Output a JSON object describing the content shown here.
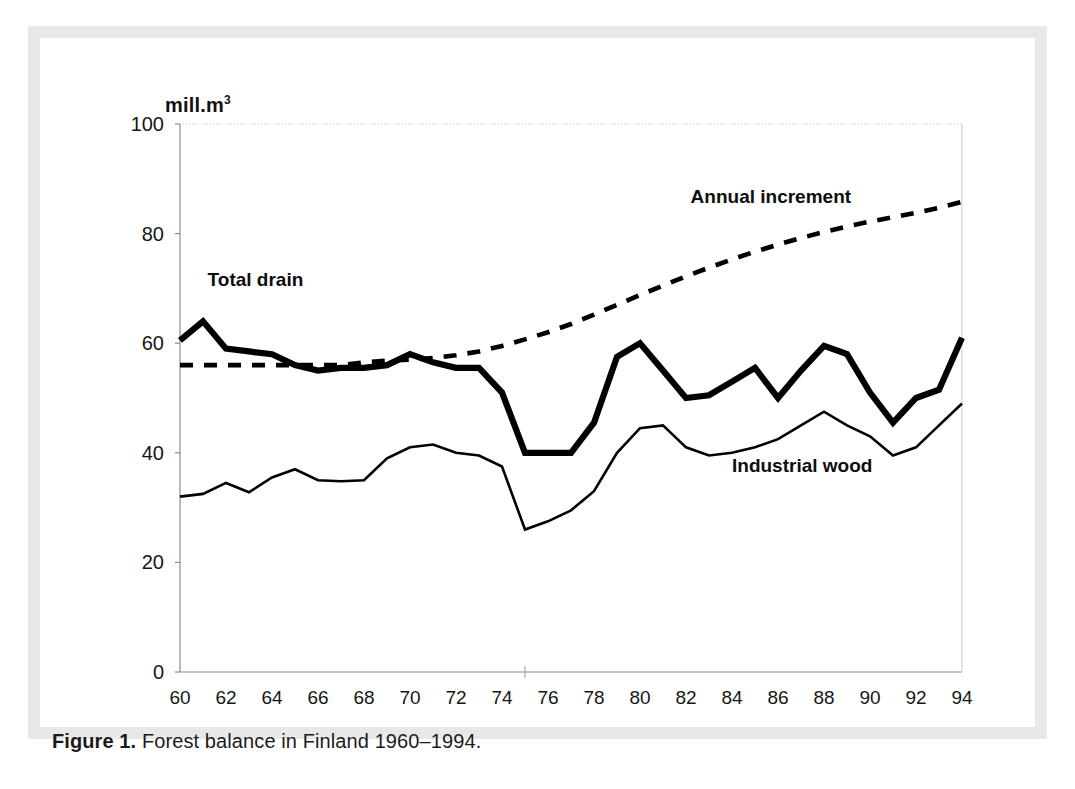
{
  "figure": {
    "caption_bold": "Figure 1.",
    "caption_text": " Forest balance in Finland 1960–1994.",
    "unit_label": "mill.m",
    "unit_sup": "3"
  },
  "colors": {
    "frame": "#e8e8e8",
    "plot_background": "#ffffff",
    "line": "#000000",
    "axis": "#8d8d8d",
    "text": "#161616"
  },
  "chart_data": {
    "type": "line",
    "title": "Forest balance in Finland 1960–1994",
    "xlabel": "",
    "ylabel": "mill.m³",
    "xlim": [
      1960,
      1994
    ],
    "ylim": [
      0,
      100
    ],
    "yticks": [
      0,
      20,
      40,
      60,
      80,
      100
    ],
    "ytick_labels": [
      "0",
      "20",
      "40",
      "60",
      "80",
      "100"
    ],
    "xticks": [
      1960,
      1962,
      1964,
      1966,
      1968,
      1970,
      1972,
      1974,
      1976,
      1978,
      1980,
      1982,
      1984,
      1986,
      1988,
      1990,
      1992,
      1994
    ],
    "xtick_labels": [
      "60",
      "62",
      "64",
      "66",
      "68",
      "70",
      "72",
      "74",
      "76",
      "78",
      "80",
      "82",
      "84",
      "86",
      "88",
      "90",
      "92",
      "94"
    ],
    "grid": false,
    "legend_position": "inline-annotations",
    "x": [
      1960,
      1961,
      1962,
      1963,
      1964,
      1965,
      1966,
      1967,
      1968,
      1969,
      1970,
      1971,
      1972,
      1973,
      1974,
      1975,
      1976,
      1977,
      1978,
      1979,
      1980,
      1981,
      1982,
      1983,
      1984,
      1985,
      1986,
      1987,
      1988,
      1989,
      1990,
      1991,
      1992,
      1993,
      1994
    ],
    "series": [
      {
        "name": "Total drain",
        "style": "solid-thick",
        "label_x": 1961.2,
        "label_y": 70.5,
        "values": [
          60.5,
          64.0,
          59.0,
          58.5,
          58.0,
          56.0,
          55.0,
          55.5,
          55.5,
          56.0,
          58.0,
          56.5,
          55.5,
          55.5,
          51.0,
          40.0,
          40.0,
          40.0,
          45.5,
          57.5,
          60.0,
          55.0,
          50.0,
          50.5,
          53.0,
          55.5,
          50.0,
          55.0,
          59.5,
          58.0,
          51.0,
          45.5,
          50.0,
          51.5,
          61.0
        ]
      },
      {
        "name": "Annual increment",
        "style": "dashed",
        "label_x": 1982.2,
        "label_y": 85.5,
        "values": [
          56.0,
          56.0,
          56.0,
          56.0,
          56.0,
          56.0,
          56.0,
          56.0,
          56.5,
          56.8,
          57.0,
          57.3,
          57.8,
          58.5,
          59.5,
          60.7,
          62.0,
          63.5,
          65.2,
          67.0,
          68.8,
          70.5,
          72.2,
          73.8,
          75.3,
          76.7,
          78.0,
          79.2,
          80.3,
          81.3,
          82.2,
          83.0,
          83.8,
          84.7,
          85.8
        ]
      },
      {
        "name": "Industrial wood",
        "style": "solid-thin",
        "label_x": 1984.0,
        "label_y": 36.5,
        "values": [
          32.0,
          32.5,
          34.5,
          32.8,
          35.5,
          37.0,
          35.0,
          34.8,
          35.0,
          39.0,
          41.0,
          41.5,
          40.0,
          39.5,
          37.5,
          26.0,
          27.5,
          29.5,
          33.0,
          40.0,
          44.5,
          45.0,
          41.0,
          39.5,
          40.0,
          41.0,
          42.5,
          45.0,
          47.5,
          45.0,
          43.0,
          39.5,
          41.0,
          45.0,
          49.0
        ]
      }
    ]
  }
}
